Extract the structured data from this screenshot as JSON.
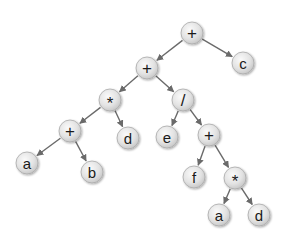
{
  "diagram": {
    "type": "expression-tree",
    "expression": "((a+b)*d + e/(f + a*d)) + c",
    "style": {
      "node_radius": 11,
      "node_fill_light": "#f4f4f4",
      "node_fill_dark": "#c8c8c8",
      "node_stroke": "#a9a9a9",
      "edge_color": "#6a6a6a",
      "background": "#ffffff"
    },
    "nodes": [
      {
        "id": "n1",
        "label": "+",
        "kind": "operator",
        "x": 192,
        "y": 33
      },
      {
        "id": "n2",
        "label": "c",
        "kind": "operand",
        "x": 243,
        "y": 63
      },
      {
        "id": "n3",
        "label": "+",
        "kind": "operator",
        "x": 147,
        "y": 68
      },
      {
        "id": "n4",
        "label": "*",
        "kind": "operator",
        "x": 110,
        "y": 100
      },
      {
        "id": "n5",
        "label": "/",
        "kind": "operator",
        "x": 183,
        "y": 100
      },
      {
        "id": "n6",
        "label": "+",
        "kind": "operator",
        "x": 70,
        "y": 131
      },
      {
        "id": "n7",
        "label": "d",
        "kind": "operand",
        "x": 128,
        "y": 138
      },
      {
        "id": "n8",
        "label": "e",
        "kind": "operand",
        "x": 167,
        "y": 137
      },
      {
        "id": "n9",
        "label": "+",
        "kind": "operator",
        "x": 209,
        "y": 135
      },
      {
        "id": "n10",
        "label": "a",
        "kind": "operand",
        "x": 27,
        "y": 163
      },
      {
        "id": "n11",
        "label": "b",
        "kind": "operand",
        "x": 92,
        "y": 172
      },
      {
        "id": "n12",
        "label": "f",
        "kind": "operand",
        "x": 194,
        "y": 177
      },
      {
        "id": "n13",
        "label": "*",
        "kind": "operator",
        "x": 235,
        "y": 178
      },
      {
        "id": "n14",
        "label": "a",
        "kind": "operand",
        "x": 219,
        "y": 215
      },
      {
        "id": "n15",
        "label": "d",
        "kind": "operand",
        "x": 259,
        "y": 215
      }
    ],
    "edges": [
      {
        "from": "n1",
        "to": "n3"
      },
      {
        "from": "n1",
        "to": "n2"
      },
      {
        "from": "n3",
        "to": "n4"
      },
      {
        "from": "n3",
        "to": "n5"
      },
      {
        "from": "n4",
        "to": "n6"
      },
      {
        "from": "n4",
        "to": "n7"
      },
      {
        "from": "n5",
        "to": "n8"
      },
      {
        "from": "n5",
        "to": "n9"
      },
      {
        "from": "n6",
        "to": "n10"
      },
      {
        "from": "n6",
        "to": "n11"
      },
      {
        "from": "n9",
        "to": "n12"
      },
      {
        "from": "n9",
        "to": "n13"
      },
      {
        "from": "n13",
        "to": "n14"
      },
      {
        "from": "n13",
        "to": "n15"
      }
    ]
  }
}
